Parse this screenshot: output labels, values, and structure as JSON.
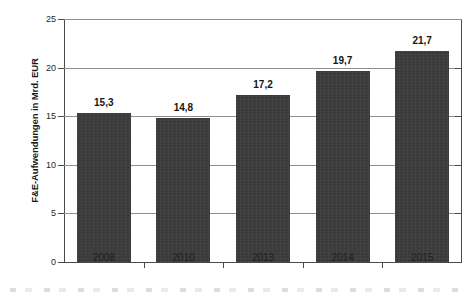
{
  "chart_data": {
    "type": "bar",
    "title": "",
    "xlabel": "",
    "ylabel": "F&E-Aufwendungen in Mrd. EUR",
    "categories": [
      "2008",
      "2010",
      "2013",
      "2014",
      "2015"
    ],
    "values": [
      15.3,
      14.8,
      17.2,
      19.7,
      21.7
    ],
    "value_labels": [
      "15,3",
      "14,8",
      "17,2",
      "19,7",
      "21,7"
    ],
    "ylim": [
      0,
      25
    ],
    "ytick_values": [
      0,
      5,
      10,
      15,
      20,
      25
    ],
    "ytick_labels": [
      "0",
      "5",
      "10",
      "15",
      "20",
      "25"
    ],
    "grid": "horizontal",
    "legend": "none",
    "series": [
      {
        "name": "F&E-Aufwendungen",
        "values": [
          15.3,
          14.8,
          17.2,
          19.7,
          21.7
        ]
      }
    ]
  },
  "style": {
    "bar_color": "#3a3a3a",
    "grid_color": "#8e8e8e",
    "axis_color": "#4a4a4a",
    "background": "#ffffff",
    "text_color": "#1a1a1a"
  }
}
